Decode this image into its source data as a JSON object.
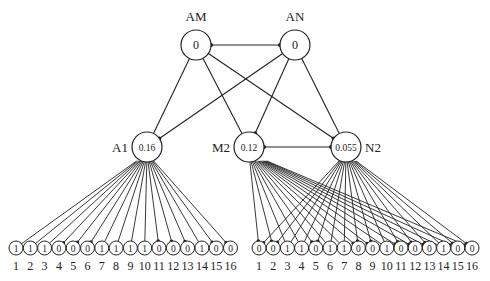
{
  "diagram": {
    "type": "network",
    "top_nodes": [
      {
        "id": "AM",
        "label": "AM",
        "value": "0",
        "cx": 196,
        "cy": 45,
        "r": 15,
        "label_pos": "above"
      },
      {
        "id": "AN",
        "label": "AN",
        "value": "0",
        "cx": 295,
        "cy": 45,
        "r": 15,
        "label_pos": "above"
      }
    ],
    "mid_nodes": [
      {
        "id": "A1",
        "label": "A1",
        "value": "0.16",
        "cx": 147,
        "cy": 147,
        "r": 15,
        "label_pos": "left"
      },
      {
        "id": "M2",
        "label": "M2",
        "value": "0.12",
        "cx": 249,
        "cy": 147,
        "r": 15,
        "label_pos": "left"
      },
      {
        "id": "N2",
        "label": "N2",
        "value": "0.055",
        "cx": 346,
        "cy": 147,
        "r": 15,
        "label_pos": "right"
      }
    ],
    "edges": [
      {
        "from": "AM",
        "to": "AN",
        "dots": "both"
      },
      {
        "from": "AM",
        "to": "A1",
        "dots": "none"
      },
      {
        "from": "AM",
        "to": "M2",
        "dots": "none"
      },
      {
        "from": "AM",
        "to": "N2",
        "dots": "end"
      },
      {
        "from": "AN",
        "to": "A1",
        "dots": "end"
      },
      {
        "from": "AN",
        "to": "M2",
        "dots": "end"
      },
      {
        "from": "AN",
        "to": "N2",
        "dots": "none"
      },
      {
        "from": "M2",
        "to": "N2",
        "dots": "both"
      }
    ],
    "left_leaves": {
      "parents": [
        "A1"
      ],
      "start_x": 16,
      "step": 14.3,
      "cy": 248,
      "r": 7,
      "label_y": 266,
      "labels": [
        "1",
        "2",
        "3",
        "4",
        "5",
        "6",
        "7",
        "8",
        "9",
        "10",
        "11",
        "12",
        "13",
        "14",
        "15",
        "16"
      ],
      "values": [
        "1",
        "1",
        "1",
        "0",
        "0",
        "0",
        "1",
        "1",
        "1",
        "1",
        "0",
        "0",
        "0",
        "1",
        "0",
        "0"
      ]
    },
    "right_leaves": {
      "parents": [
        "M2",
        "N2"
      ],
      "start_x": 259,
      "step": 14.2,
      "cy": 248,
      "r": 7,
      "label_y": 266,
      "labels": [
        "1",
        "2",
        "3",
        "4",
        "5",
        "6",
        "7",
        "8",
        "9",
        "10",
        "11",
        "12",
        "13",
        "14",
        "15",
        "16"
      ],
      "values": [
        "0",
        "0",
        "1",
        "1",
        "0",
        "1",
        "1",
        "0",
        "0",
        "1",
        "0",
        "0",
        "0",
        "1",
        "0",
        "0"
      ]
    }
  }
}
